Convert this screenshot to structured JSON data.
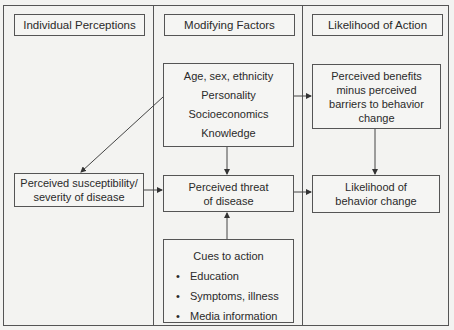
{
  "diagram": {
    "columns": [
      {
        "header": "Individual Perceptions"
      },
      {
        "header": "Modifying Factors"
      },
      {
        "header": "Likelihood of Action"
      }
    ],
    "modifying_factors": [
      "Age, sex, ethnicity",
      "Personality",
      "Socioeconomics",
      "Knowledge"
    ],
    "susceptibility": [
      "Perceived susceptibility/",
      "severity of disease"
    ],
    "threat": [
      "Perceived threat",
      "of disease"
    ],
    "benefits": [
      "Perceived benefits",
      "minus perceived",
      "barriers to behavior",
      "change"
    ],
    "likelihood": [
      "Likelihood of",
      "behavior change"
    ],
    "cues": {
      "title": "Cues to action",
      "bullet": "•",
      "items": [
        "Education",
        "Symptoms, illness",
        "Media information"
      ]
    },
    "edges": [
      {
        "from": "modifying_factors",
        "to": "susceptibility"
      },
      {
        "from": "modifying_factors",
        "to": "threat"
      },
      {
        "from": "modifying_factors",
        "to": "benefits"
      },
      {
        "from": "susceptibility",
        "to": "threat"
      },
      {
        "from": "threat",
        "to": "likelihood"
      },
      {
        "from": "benefits",
        "to": "likelihood"
      },
      {
        "from": "cues",
        "to": "threat"
      }
    ],
    "colors": {
      "line": "#555555",
      "background": "#f3f3f1",
      "text": "#2a2a2a"
    }
  }
}
